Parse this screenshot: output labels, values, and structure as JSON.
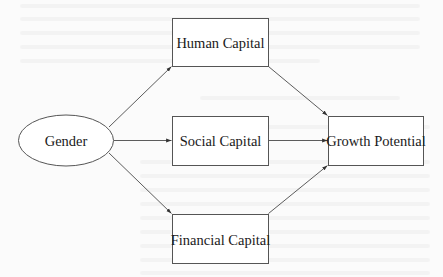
{
  "diagram": {
    "type": "path-diagram",
    "colors": {
      "stroke": "#555555",
      "edge": "#4a4a4a",
      "text": "#1a1a1a",
      "fill": "#ffffff",
      "background": "#fbfbfb"
    },
    "nodes": {
      "gender": {
        "label": "Gender",
        "shape": "ellipse"
      },
      "human_capital": {
        "label": "Human Capital",
        "shape": "rectangle"
      },
      "social_capital": {
        "label": "Social Capital",
        "shape": "rectangle"
      },
      "financial_capital": {
        "label": "Financial Capital",
        "shape": "rectangle"
      },
      "growth_potential": {
        "label": "Growth Potential",
        "shape": "rectangle"
      }
    },
    "edges": [
      {
        "from": "Gender",
        "to": "Human Capital"
      },
      {
        "from": "Gender",
        "to": "Social Capital"
      },
      {
        "from": "Gender",
        "to": "Financial Capital"
      },
      {
        "from": "Human Capital",
        "to": "Growth Potential"
      },
      {
        "from": "Social Capital",
        "to": "Growth Potential"
      },
      {
        "from": "Financial Capital",
        "to": "Growth Potential"
      }
    ]
  }
}
